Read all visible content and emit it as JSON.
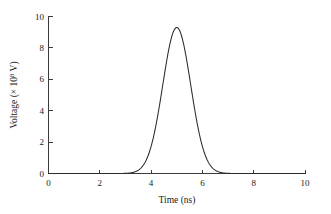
{
  "chart_data": {
    "type": "line",
    "title": "",
    "subtitle": "",
    "xlabel": "Time (ns)",
    "ylabel_prefix": "Voltage (× 10",
    "ylabel_exponent": "8",
    "ylabel_suffix": " V)",
    "ylabel_full": "Voltage (× 10⁸ V)",
    "xlim": [
      0,
      10
    ],
    "ylim": [
      0,
      10
    ],
    "xticks": [
      0,
      2,
      4,
      6,
      8,
      10
    ],
    "yticks": [
      0,
      2,
      4,
      6,
      8,
      10
    ],
    "xticklabels": [
      "0",
      "2",
      "4",
      "6",
      "8",
      "10"
    ],
    "yticklabels": [
      "0",
      "2",
      "4",
      "6",
      "8",
      "10"
    ],
    "grid": false,
    "legend": false,
    "legend_position": "none",
    "curve_color": "#2b2b2b",
    "axis_color": "#3a3a3a",
    "background_color": "#ffffff",
    "series": [
      {
        "name": "Voltage pulse",
        "shape": "gaussian",
        "peak_value": 9.3,
        "peak_time": 5.0,
        "fwhm": 1.28,
        "sigma": 0.545,
        "baseline": 0.0,
        "onset_time": 3.6,
        "offset_time": 6.4,
        "x": [
          0.0,
          0.5,
          1.0,
          1.5,
          2.0,
          2.5,
          3.0,
          3.2,
          3.4,
          3.6,
          3.8,
          4.0,
          4.2,
          4.4,
          4.6,
          4.8,
          5.0,
          5.2,
          5.4,
          5.6,
          5.8,
          6.0,
          6.2,
          6.4,
          6.6,
          6.8,
          7.0,
          7.5,
          8.0,
          8.5,
          9.0,
          9.5,
          10.0
        ],
        "values": [
          0.0,
          0.0,
          0.0,
          0.0,
          0.0,
          0.0,
          0.01,
          0.04,
          0.11,
          0.29,
          0.7,
          1.51,
          2.89,
          4.88,
          7.2,
          8.98,
          9.3,
          8.98,
          7.2,
          4.88,
          2.89,
          1.51,
          0.7,
          0.29,
          0.11,
          0.04,
          0.01,
          0.0,
          0.0,
          0.0,
          0.0,
          0.0,
          0.0
        ]
      }
    ]
  },
  "figure": {
    "name": "voltage-pulse-plot"
  }
}
